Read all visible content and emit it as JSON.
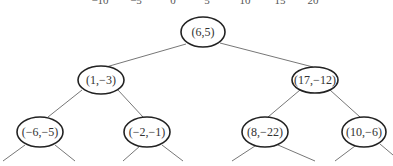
{
  "diagram": {
    "type": "kd-tree",
    "axis_ticks": [
      "−10",
      "−5",
      "0",
      "5",
      "10",
      "15",
      "20"
    ],
    "nodes": [
      {
        "id": "root",
        "label": "(6,5)",
        "level": 0
      },
      {
        "id": "n1",
        "label": "(1,−3)",
        "level": 1,
        "parent": "root"
      },
      {
        "id": "n2",
        "label": "(17,−12)",
        "level": 1,
        "parent": "root"
      },
      {
        "id": "n3",
        "label": "(−6,−5)",
        "level": 2,
        "parent": "n1"
      },
      {
        "id": "n4",
        "label": "(−2,−1)",
        "level": 2,
        "parent": "n1"
      },
      {
        "id": "n5",
        "label": "(8,−22)",
        "level": 2,
        "parent": "n2"
      },
      {
        "id": "n6",
        "label": "(10,−6)",
        "level": 2,
        "parent": "n2"
      }
    ]
  }
}
